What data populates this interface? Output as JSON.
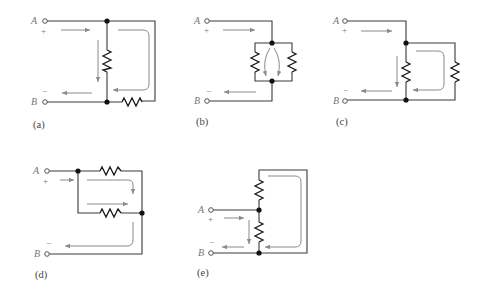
{
  "figure": {
    "terminals": {
      "top": "A",
      "bottom": "B",
      "plus": "+",
      "minus": "−"
    },
    "panels": [
      {
        "id": "a",
        "caption": "(a)",
        "description": "One resistor between A and B node; second resistor in loop shorted by wire path"
      },
      {
        "id": "b",
        "caption": "(b)",
        "description": "Two resistors in parallel between A and B"
      },
      {
        "id": "c",
        "caption": "(c)",
        "description": "Resistor A-B with parallel resistor branch"
      },
      {
        "id": "d",
        "caption": "(d)",
        "description": "Two resistors in parallel between A node and B"
      },
      {
        "id": "e",
        "caption": "(e)",
        "description": "Resistor A-B, second resistor shorted by wire loop"
      }
    ],
    "colors": {
      "wire": "#3a3a3a",
      "resistor": "#1a1a1a",
      "current_arrow": "#8a8a8a",
      "label": "#777777"
    }
  }
}
